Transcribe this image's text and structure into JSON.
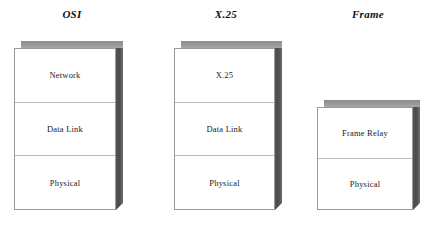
{
  "diagram": {
    "background_color": "#ffffff",
    "box_face_color": "#ffffff",
    "box_border_color": "#9a9a9a",
    "box_top_shade_color": "#9a9a9a",
    "box_side_shade_color": "#4a4a4a",
    "stacks": [
      {
        "id": "osi",
        "title": "OSI",
        "layers": [
          {
            "label": "Network"
          },
          {
            "label": "Data Link"
          },
          {
            "label": "Physical"
          }
        ]
      },
      {
        "id": "x25",
        "title": "X.25",
        "layers": [
          {
            "label": "X.25"
          },
          {
            "label": "Data Link"
          },
          {
            "label": "Physical"
          }
        ]
      },
      {
        "id": "frame",
        "title": "Frame",
        "layers": [
          {
            "label": "Frame Relay"
          },
          {
            "label": "Physical"
          }
        ]
      }
    ]
  }
}
